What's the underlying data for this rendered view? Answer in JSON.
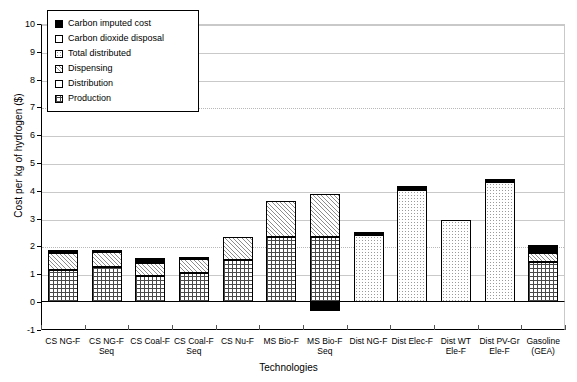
{
  "chart_data": {
    "type": "bar",
    "title": "",
    "xlabel": "Technologies",
    "ylabel": "Cost per kg of hydrogen ($)",
    "ylim": [
      -1,
      10
    ],
    "yticks": [
      -1,
      0,
      1,
      2,
      3,
      4,
      5,
      6,
      7,
      8,
      9,
      10
    ],
    "grid": true,
    "stacked": true,
    "legend_position": "top-left",
    "legend": [
      {
        "label": "Carbon imputed cost",
        "pattern": "solid-black"
      },
      {
        "label": "Carbon dioxide disposal",
        "pattern": "white"
      },
      {
        "label": "Total distributed",
        "pattern": "fine-dots"
      },
      {
        "label": "Dispensing",
        "pattern": "diagonal-hatch"
      },
      {
        "label": "Distribution",
        "pattern": "white"
      },
      {
        "label": "Production",
        "pattern": "cross-grid"
      }
    ],
    "categories": [
      "CS NG-F",
      "CS NG-F Seq",
      "CS Coal-F",
      "CS Coal-F Seq",
      "CS Nu-F",
      "MS Bio-F",
      "MS Bio-F Seq",
      "Dist NG-F",
      "Dist Elec-F",
      "Dist WT Ele-F",
      "Dist PV-Gr Ele-F",
      "Gasoline (GEA)"
    ],
    "category_lines": [
      [
        "CS NG-F"
      ],
      [
        "CS NG-F",
        "Seq"
      ],
      [
        "CS Coal-F"
      ],
      [
        "CS Coal-F",
        "Seq"
      ],
      [
        "CS Nu-F"
      ],
      [
        "MS Bio-F"
      ],
      [
        "MS Bio-F",
        "Seq"
      ],
      [
        "Dist NG-F"
      ],
      [
        "Dist Elec-F"
      ],
      [
        "Dist WT",
        "Ele-F"
      ],
      [
        "Dist PV-Gr",
        "Ele-F"
      ],
      [
        "Gasoline",
        "(GEA)"
      ]
    ],
    "series": [
      {
        "name": "Production",
        "pattern": "cross-grid",
        "values": [
          1.15,
          1.25,
          0.95,
          1.05,
          1.5,
          2.35,
          2.35,
          0.0,
          0.0,
          0.0,
          0.0,
          1.45
        ]
      },
      {
        "name": "Distribution",
        "pattern": "white",
        "values": [
          0.0,
          0.0,
          0.0,
          0.0,
          0.0,
          0.0,
          0.0,
          0.0,
          0.0,
          0.0,
          0.0,
          0.0
        ]
      },
      {
        "name": "Dispensing",
        "pattern": "diagonal-hatch",
        "values": [
          0.6,
          0.55,
          0.45,
          0.5,
          0.85,
          1.3,
          1.55,
          0.0,
          0.0,
          0.0,
          0.0,
          0.33
        ]
      },
      {
        "name": "Total distributed",
        "pattern": "fine-dots",
        "values": [
          0.0,
          0.0,
          0.0,
          0.0,
          0.0,
          0.0,
          0.0,
          2.42,
          4.02,
          2.95,
          4.3,
          0.0
        ]
      },
      {
        "name": "Carbon dioxide disposal",
        "pattern": "white",
        "values": [
          0.0,
          0.0,
          0.0,
          0.0,
          0.0,
          0.0,
          0.0,
          0.0,
          0.0,
          0.0,
          0.0,
          0.0
        ]
      },
      {
        "name": "Carbon imputed cost",
        "pattern": "solid-black",
        "values": [
          0.12,
          0.05,
          0.17,
          0.07,
          0.0,
          0.0,
          0.0,
          0.1,
          0.15,
          0.0,
          0.12,
          0.27
        ]
      }
    ],
    "negative_values": [
      {
        "category": "MS Bio-F Seq",
        "series": "Carbon imputed cost",
        "value": -0.33
      }
    ],
    "bar_totals": [
      1.87,
      1.85,
      1.57,
      1.62,
      2.35,
      3.65,
      3.9,
      2.52,
      4.17,
      2.95,
      4.42,
      2.05
    ]
  }
}
